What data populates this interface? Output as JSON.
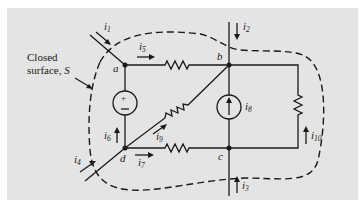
{
  "figure": {
    "background_color": "#e4e4e4",
    "line_color": "#1a1a1a",
    "surface_label": {
      "line1": "Closed",
      "line2": "surface, ",
      "symbol": "S"
    },
    "nodes": [
      {
        "id": "a",
        "label": "a"
      },
      {
        "id": "b",
        "label": "b"
      },
      {
        "id": "c",
        "label": "c"
      },
      {
        "id": "d",
        "label": "d"
      }
    ],
    "currents": [
      {
        "name": "i",
        "sub": "1"
      },
      {
        "name": "i",
        "sub": "2"
      },
      {
        "name": "i",
        "sub": "3"
      },
      {
        "name": "i",
        "sub": "4"
      },
      {
        "name": "i",
        "sub": "5"
      },
      {
        "name": "i",
        "sub": "6"
      },
      {
        "name": "i",
        "sub": "7"
      },
      {
        "name": "i",
        "sub": "8"
      },
      {
        "name": "i",
        "sub": "9"
      },
      {
        "name": "i",
        "sub": "10"
      }
    ],
    "components": [
      {
        "type": "resistor",
        "between": "a-b",
        "current": "i5"
      },
      {
        "type": "voltage-source",
        "between": "a-d",
        "polarity_top": "+",
        "polarity_bottom": "−",
        "current": "i6"
      },
      {
        "type": "resistor",
        "between": "d-b",
        "current": "i9"
      },
      {
        "type": "resistor",
        "between": "d-c",
        "current": "i7"
      },
      {
        "type": "current-source",
        "between": "c-b",
        "current": "i8"
      },
      {
        "type": "resistor",
        "between": "b-c (right branch)",
        "current": "i10"
      }
    ]
  }
}
